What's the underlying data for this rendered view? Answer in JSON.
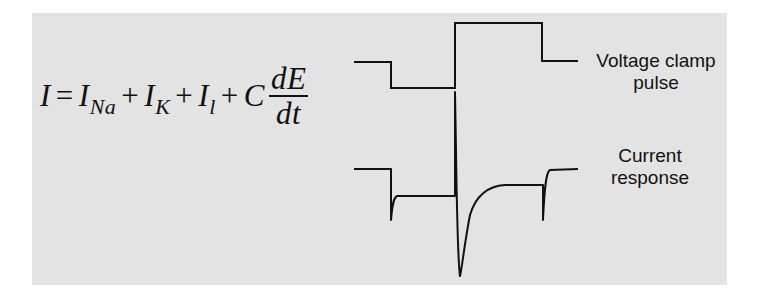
{
  "figure": {
    "background_color": "#e3e3e3",
    "line_color": "#111111"
  },
  "equation": {
    "lhs": "I",
    "equals": "=",
    "terms": [
      {
        "symbol": "I",
        "subscript": "Na"
      },
      {
        "symbol": "I",
        "subscript": "K"
      },
      {
        "symbol": "I",
        "subscript": "l"
      }
    ],
    "plus": "+",
    "capacitance": "C",
    "derivative_numerator": "dE",
    "derivative_denominator": "dt"
  },
  "labels": {
    "voltage_line1": "Voltage clamp",
    "voltage_line2": "pulse",
    "current_line1": "Current",
    "current_line2": "response"
  },
  "traces": {
    "voltage_clamp_pulse": {
      "description": "Step down (hyperpolarizing), then step up (depolarizing), then return to holding level",
      "points": [
        [
          354,
          62
        ],
        [
          391,
          62
        ],
        [
          391,
          88
        ],
        [
          455,
          88
        ],
        [
          455,
          23
        ],
        [
          542,
          23
        ],
        [
          542,
          61
        ],
        [
          578,
          61
        ]
      ]
    },
    "current_response": {
      "description": "Capacitive transients at each step; large inward Na current dip after depolarization, then outward K current plateau",
      "segments": [
        "baseline",
        "capacitive spike down",
        "hyperpolarized plateau",
        "capacitive spike up",
        "inward current trough",
        "outward plateau",
        "capacitive spike down",
        "baseline"
      ]
    }
  }
}
